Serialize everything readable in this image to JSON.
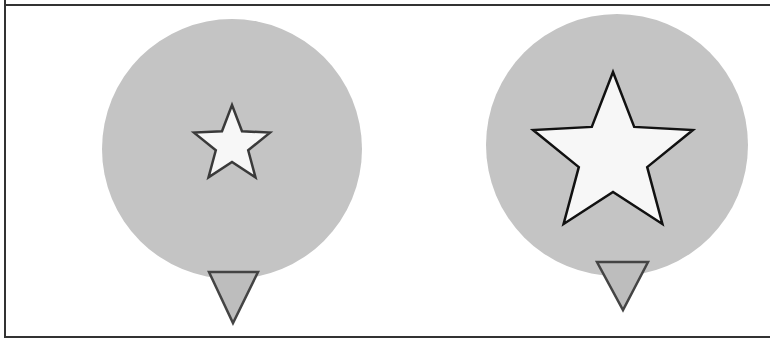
{
  "figure": {
    "colors": {
      "background": "#ffffff",
      "frame": "#333333",
      "circle_fill": "#c4c4c4",
      "star_fill": "#f7f7f7",
      "star_stroke_left": "#3a3a3a",
      "star_stroke_right": "#111111",
      "triangle_fill": "#bdbdbd",
      "triangle_stroke": "#444444"
    },
    "panels": [
      {
        "name": "left",
        "circle": {
          "cx": 232,
          "cy": 149,
          "r": 130
        },
        "star": {
          "cx": 232,
          "cy": 145,
          "outer_r": 40,
          "inner_r": 17,
          "stroke_width": 2.5
        },
        "pointer": {
          "x1": 209,
          "x2": 258,
          "top": 272,
          "tip_x": 233,
          "tip_y": 323
        }
      },
      {
        "name": "right",
        "circle": {
          "cx": 617,
          "cy": 145,
          "r": 131
        },
        "star": {
          "cx": 613,
          "cy": 156,
          "outer_r": 84,
          "inner_r": 36,
          "stroke_width": 2.5
        },
        "pointer": {
          "x1": 597,
          "x2": 648,
          "top": 262,
          "tip_x": 623,
          "tip_y": 310
        }
      }
    ]
  }
}
